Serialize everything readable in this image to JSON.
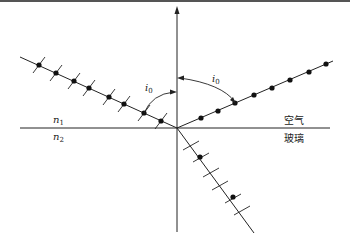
{
  "diagram": {
    "type": "optics-reflection-refraction",
    "labels": {
      "incident_angle_left": {
        "base": "i",
        "sub": "0"
      },
      "reflect_angle_right": {
        "base": "i",
        "sub": "0"
      },
      "medium_top_index": {
        "base": "n",
        "sub": "1"
      },
      "medium_bottom_index": {
        "base": "n",
        "sub": "2"
      },
      "medium_top_name": "空气",
      "medium_bottom_name": "玻璃"
    },
    "colors": {
      "line": "#222222",
      "dot": "#111111",
      "background": "#ffffff",
      "top_border": "#555555"
    },
    "geometry": {
      "origin": [
        177,
        128
      ],
      "normal_top": [
        177,
        10
      ],
      "normal_bottom": [
        177,
        232
      ],
      "interface_left": [
        20,
        128
      ],
      "interface_right": [
        330,
        128
      ],
      "incident_start": [
        20,
        57
      ],
      "reflected_end": [
        330,
        62
      ],
      "refracted_end": [
        252,
        232
      ],
      "incident_dots": [
        [
          39,
          65
        ],
        [
          56,
          73
        ],
        [
          74,
          81
        ],
        [
          89,
          88
        ],
        [
          109,
          97
        ],
        [
          124,
          104
        ],
        [
          144,
          113
        ],
        [
          161,
          121
        ]
      ],
      "reflected_dots": [
        [
          201,
          118
        ],
        [
          218,
          111
        ],
        [
          235,
          103
        ],
        [
          254,
          95
        ],
        [
          272,
          88
        ],
        [
          290,
          80
        ],
        [
          309,
          72
        ],
        [
          326,
          64
        ]
      ],
      "refracted_dots": [
        [
          200,
          157
        ],
        [
          233,
          197
        ]
      ],
      "incident_ticks": 9,
      "refracted_ticks": 6
    }
  }
}
